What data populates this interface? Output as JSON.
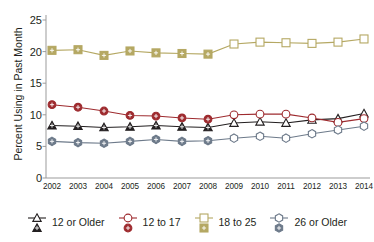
{
  "chart_data": {
    "type": "line",
    "title": "",
    "xlabel": "",
    "ylabel": "Percent Using in Past Month",
    "x": [
      2002,
      2003,
      2004,
      2005,
      2006,
      2007,
      2008,
      2009,
      2010,
      2011,
      2012,
      2013,
      2014
    ],
    "categories": [
      "2002",
      "2003",
      "2004",
      "2005",
      "2006",
      "2007",
      "2008",
      "2009",
      "2010",
      "2011",
      "2012",
      "2013",
      "2014"
    ],
    "ylim": [
      0,
      25
    ],
    "yticks": [
      0,
      5,
      10,
      15,
      20,
      25
    ],
    "ytick_labels": [
      "0",
      "5",
      "10",
      "15",
      "20",
      "25"
    ],
    "grid": false,
    "legend_position": "bottom",
    "marker_style_note": "filled markers 2002-2008, open markers 2009-2014",
    "open_marker_start_year": 2009,
    "series": [
      {
        "name": "12 or Older",
        "color": "#231f20",
        "marker": "triangle",
        "values": [
          8.3,
          8.2,
          8.0,
          8.1,
          8.3,
          8.1,
          8.0,
          8.7,
          8.9,
          8.7,
          9.2,
          9.4,
          10.2
        ]
      },
      {
        "name": "12 to 17",
        "color": "#9e2b2f",
        "marker": "circle",
        "values": [
          11.6,
          11.2,
          10.6,
          9.9,
          9.8,
          9.5,
          9.3,
          10.0,
          10.1,
          10.1,
          9.5,
          8.8,
          9.4
        ]
      },
      {
        "name": "18 to 25",
        "color": "#b5a863",
        "marker": "square",
        "values": [
          20.2,
          20.3,
          19.4,
          20.1,
          19.8,
          19.7,
          19.6,
          21.2,
          21.5,
          21.4,
          21.3,
          21.5,
          22.0
        ]
      },
      {
        "name": "26 or Older",
        "color": "#6d7a8a",
        "marker": "hexagon",
        "values": [
          5.8,
          5.6,
          5.5,
          5.8,
          6.1,
          5.8,
          5.9,
          6.3,
          6.6,
          6.3,
          7.0,
          7.6,
          8.2
        ]
      }
    ]
  },
  "legend": {
    "items": [
      {
        "label": "12 or Older",
        "icon": "triangle-marker-icon"
      },
      {
        "label": "12 to 17",
        "icon": "circle-marker-icon"
      },
      {
        "label": "18 to 25",
        "icon": "square-marker-icon"
      },
      {
        "label": "26 or Older",
        "icon": "hexagon-marker-icon"
      }
    ]
  }
}
